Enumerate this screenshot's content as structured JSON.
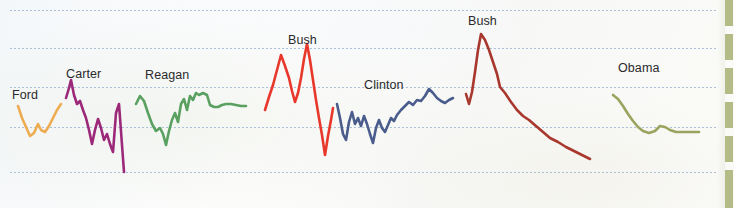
{
  "figure": {
    "title": "",
    "background_color": "#fbfcfd",
    "gridline_color": "#9bb6d4",
    "label_color": "#2a2a2c"
  },
  "grid": {
    "y_positions": [
      10,
      48,
      87,
      127,
      172
    ],
    "style": "dotted",
    "x_start": 10,
    "x_end": 716
  },
  "edge_rule": {
    "name": "page-edge-marker",
    "color": "#b5bb86",
    "segments": [
      {
        "top": 0,
        "height": 26
      },
      {
        "top": 34,
        "height": 26
      },
      {
        "top": 68,
        "height": 26
      },
      {
        "top": 102,
        "height": 26
      },
      {
        "top": 136,
        "height": 26
      },
      {
        "top": 170,
        "height": 26
      },
      {
        "top": 196,
        "height": 12
      }
    ]
  },
  "chart_data": {
    "type": "line",
    "title": "",
    "subtitle": "",
    "xlabel": "",
    "ylabel": "",
    "grid": true,
    "legend_position": "inline-above-series",
    "xlim": [
      0,
      734
    ],
    "ylim": [
      208,
      0
    ],
    "note": "Seven presidential-administration line segments drawn in pixel coordinates of the source figure; each point is [x, y] in image pixels.",
    "series": [
      {
        "name": "Ford",
        "label": "Ford",
        "color": "#eeac52",
        "label_x": 12,
        "label_y": 88,
        "points": [
          [
            18,
            106
          ],
          [
            22,
            118
          ],
          [
            26,
            127
          ],
          [
            30,
            136
          ],
          [
            34,
            133
          ],
          [
            38,
            124
          ],
          [
            41,
            130
          ],
          [
            45,
            132
          ],
          [
            49,
            126
          ],
          [
            53,
            118
          ],
          [
            57,
            110
          ],
          [
            61,
            104
          ]
        ]
      },
      {
        "name": "Carter",
        "label": "Carter",
        "color": "#9b2878",
        "label_x": 66,
        "label_y": 67,
        "points": [
          [
            66,
            98
          ],
          [
            69,
            88
          ],
          [
            71,
            80
          ],
          [
            74,
            95
          ],
          [
            77,
            104
          ],
          [
            80,
            101
          ],
          [
            83,
            110
          ],
          [
            86,
            118
          ],
          [
            89,
            130
          ],
          [
            92,
            144
          ],
          [
            95,
            130
          ],
          [
            98,
            119
          ],
          [
            101,
            128
          ],
          [
            104,
            140
          ],
          [
            107,
            134
          ],
          [
            110,
            144
          ],
          [
            113,
            152
          ],
          [
            116,
            113
          ],
          [
            119,
            104
          ],
          [
            122,
            145
          ],
          [
            124,
            172
          ]
        ]
      },
      {
        "name": "Reagan",
        "label": "Reagan",
        "color": "#5aa161",
        "label_x": 145,
        "label_y": 68,
        "points": [
          [
            136,
            104
          ],
          [
            140,
            96
          ],
          [
            144,
            101
          ],
          [
            148,
            113
          ],
          [
            152,
            124
          ],
          [
            156,
            131
          ],
          [
            160,
            128
          ],
          [
            163,
            134
          ],
          [
            166,
            145
          ],
          [
            169,
            131
          ],
          [
            172,
            120
          ],
          [
            175,
            113
          ],
          [
            178,
            122
          ],
          [
            181,
            104
          ],
          [
            184,
            99
          ],
          [
            187,
            110
          ],
          [
            190,
            96
          ],
          [
            193,
            100
          ],
          [
            196,
            93
          ],
          [
            199,
            95
          ],
          [
            203,
            93
          ],
          [
            207,
            95
          ],
          [
            210,
            105
          ],
          [
            214,
            107
          ],
          [
            218,
            107
          ],
          [
            222,
            105
          ],
          [
            226,
            104
          ],
          [
            231,
            104
          ],
          [
            236,
            105
          ],
          [
            241,
            106
          ],
          [
            246,
            106
          ]
        ]
      },
      {
        "name": "Bush",
        "label": "Bush",
        "color": "#e8382c",
        "label_x": 288,
        "label_y": 33,
        "points": [
          [
            265,
            110
          ],
          [
            269,
            97
          ],
          [
            273,
            85
          ],
          [
            277,
            70
          ],
          [
            281,
            55
          ],
          [
            285,
            66
          ],
          [
            289,
            78
          ],
          [
            292,
            91
          ],
          [
            295,
            102
          ],
          [
            298,
            93
          ],
          [
            301,
            78
          ],
          [
            304,
            59
          ],
          [
            307,
            44
          ],
          [
            310,
            60
          ],
          [
            313,
            80
          ],
          [
            316,
            100
          ],
          [
            319,
            118
          ],
          [
            322,
            135
          ],
          [
            325,
            155
          ],
          [
            328,
            136
          ],
          [
            331,
            120
          ],
          [
            333,
            108
          ]
        ]
      },
      {
        "name": "Clinton",
        "label": "Clinton",
        "color": "#4a5c8c",
        "label_x": 364,
        "label_y": 78,
        "points": [
          [
            337,
            104
          ],
          [
            340,
            118
          ],
          [
            343,
            134
          ],
          [
            346,
            140
          ],
          [
            349,
            122
          ],
          [
            352,
            112
          ],
          [
            355,
            124
          ],
          [
            358,
            118
          ],
          [
            361,
            126
          ],
          [
            364,
            116
          ],
          [
            367,
            124
          ],
          [
            370,
            134
          ],
          [
            373,
            143
          ],
          [
            376,
            128
          ],
          [
            379,
            120
          ],
          [
            382,
            128
          ],
          [
            385,
            132
          ],
          [
            388,
            125
          ],
          [
            391,
            118
          ],
          [
            394,
            121
          ],
          [
            397,
            115
          ],
          [
            401,
            110
          ],
          [
            405,
            106
          ],
          [
            409,
            102
          ],
          [
            413,
            105
          ],
          [
            417,
            100
          ],
          [
            421,
            101
          ],
          [
            425,
            96
          ],
          [
            429,
            89
          ],
          [
            433,
            93
          ],
          [
            437,
            98
          ],
          [
            441,
            101
          ],
          [
            445,
            103
          ],
          [
            449,
            100
          ],
          [
            453,
            98
          ]
        ]
      },
      {
        "name": "Bush",
        "label": "Bush",
        "color": "#a8372e",
        "label_x": 468,
        "label_y": 14,
        "points": [
          [
            466,
            94
          ],
          [
            469,
            104
          ],
          [
            472,
            92
          ],
          [
            475,
            72
          ],
          [
            478,
            50
          ],
          [
            481,
            34
          ],
          [
            485,
            40
          ],
          [
            489,
            50
          ],
          [
            493,
            62
          ],
          [
            497,
            74
          ],
          [
            500,
            87
          ],
          [
            505,
            93
          ],
          [
            511,
            102
          ],
          [
            517,
            110
          ],
          [
            523,
            116
          ],
          [
            529,
            120
          ],
          [
            536,
            126
          ],
          [
            543,
            132
          ],
          [
            550,
            138
          ],
          [
            558,
            142
          ],
          [
            566,
            147
          ],
          [
            574,
            151
          ],
          [
            582,
            155
          ],
          [
            590,
            159
          ]
        ]
      },
      {
        "name": "Obama",
        "label": "Obama",
        "color": "#9aa45f",
        "label_x": 618,
        "label_y": 61,
        "points": [
          [
            613,
            95
          ],
          [
            618,
            99
          ],
          [
            623,
            106
          ],
          [
            628,
            114
          ],
          [
            633,
            121
          ],
          [
            638,
            127
          ],
          [
            643,
            131
          ],
          [
            649,
            133
          ],
          [
            655,
            131
          ],
          [
            660,
            126
          ],
          [
            665,
            127
          ],
          [
            670,
            130
          ],
          [
            676,
            132
          ],
          [
            682,
            132
          ],
          [
            688,
            132
          ],
          [
            694,
            132
          ],
          [
            699,
            132
          ]
        ]
      }
    ]
  }
}
